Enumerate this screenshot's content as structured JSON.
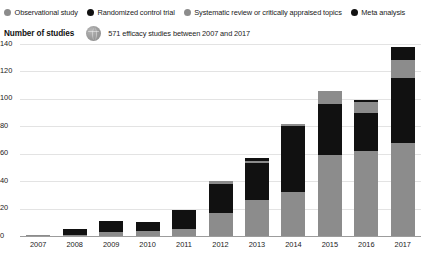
{
  "legend": {
    "items": [
      {
        "label": "Observational study",
        "color": "#8c8c8c",
        "icon": "legend-dot-icon"
      },
      {
        "label": "Randomized control trial",
        "color": "#111111",
        "icon": "legend-dot-icon"
      },
      {
        "label": "Systematic review or critically appraised topics",
        "color": "#8c8c8c",
        "icon": "legend-dot-icon"
      },
      {
        "label": "Meta analysis",
        "color": "#111111",
        "icon": "legend-dot-icon"
      }
    ]
  },
  "subtitle": {
    "axis_title": "Number of studies",
    "note": "571 efficacy studies between 2007 and 2017",
    "icon": "globe-icon"
  },
  "chart_data": {
    "type": "bar",
    "stacked": true,
    "title": "",
    "xlabel": "",
    "ylabel": "Number of studies",
    "ylim": [
      0,
      140
    ],
    "yticks": [
      0,
      20,
      40,
      60,
      80,
      100,
      120,
      140
    ],
    "grid": true,
    "legend_position": "top",
    "categories": [
      "2007",
      "2008",
      "2009",
      "2010",
      "2011",
      "2012",
      "2013",
      "2014",
      "2015",
      "2016",
      "2017"
    ],
    "series": [
      {
        "name": "Observational study",
        "color": "#8c8c8c",
        "values": [
          1,
          1,
          3,
          4,
          5,
          17,
          26,
          32,
          59,
          62,
          68
        ]
      },
      {
        "name": "Randomized control trial",
        "color": "#111111",
        "values": [
          0,
          4,
          8,
          6,
          14,
          21,
          27,
          48,
          37,
          28,
          47
        ]
      },
      {
        "name": "Systematic review or critically appraised topics",
        "color": "#8c8c8c",
        "values": [
          0,
          0,
          0,
          0,
          0,
          2,
          2,
          2,
          10,
          8,
          13
        ]
      },
      {
        "name": "Meta analysis",
        "color": "#111111",
        "values": [
          0,
          0,
          0,
          0,
          0,
          0,
          2,
          0,
          0,
          1,
          10
        ]
      }
    ],
    "totals": [
      1,
      5,
      11,
      10,
      19,
      40,
      57,
      82,
      106,
      99,
      138
    ]
  }
}
